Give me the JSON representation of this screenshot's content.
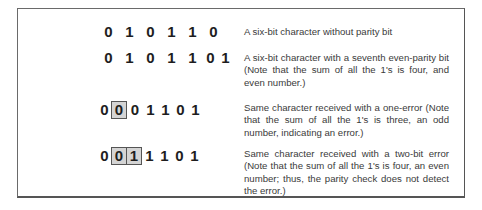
{
  "rows": [
    {
      "bits": [
        "0",
        "1",
        "0",
        "1",
        "1",
        "0"
      ],
      "boxed": [],
      "description": "A six-bit character without parity bit"
    },
    {
      "bits": [
        "0",
        "1",
        "0",
        "1",
        "1",
        "0",
        "1"
      ],
      "boxed": [],
      "description": "A six-bit character with a seventh even-parity bit (Note that the sum of all the 1's is four, and even number.)"
    },
    {
      "bits": [
        "0",
        "0",
        "0",
        "1",
        "1",
        "0",
        "1"
      ],
      "boxed": [
        1
      ],
      "description": "Same character received with a one-error (Note that the sum of all the 1's is three, an odd number, indicating an error.)"
    },
    {
      "bits": [
        "0",
        "0",
        "1",
        "1",
        "1",
        "0",
        "1"
      ],
      "boxed": [
        1,
        2
      ],
      "description": "Same character received with a two-bit error (Note that the sum of all the 1's is four, an even number; thus, the parity check does not detect the error.)"
    }
  ]
}
